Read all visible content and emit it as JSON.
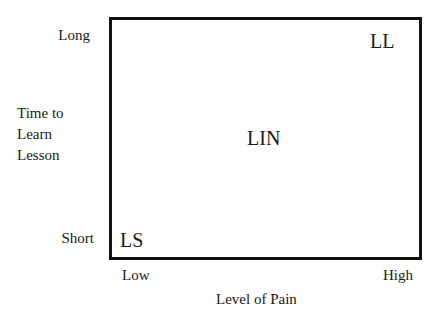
{
  "diagram": {
    "type": "2x2 quadrant diagram",
    "x_axis": {
      "title": "Level of Pain",
      "low_label": "Low",
      "high_label": "High"
    },
    "y_axis": {
      "title": "Time to\nLearn\nLesson",
      "high_label": "Long",
      "low_label": "Short"
    },
    "points": [
      {
        "label": "LL",
        "position": "top-right"
      },
      {
        "label": "LIN",
        "position": "center"
      },
      {
        "label": "LS",
        "position": "bottom-left"
      }
    ],
    "colors": {
      "line": "#111111",
      "text": "#1a1a1a",
      "background": "#ffffff"
    }
  }
}
